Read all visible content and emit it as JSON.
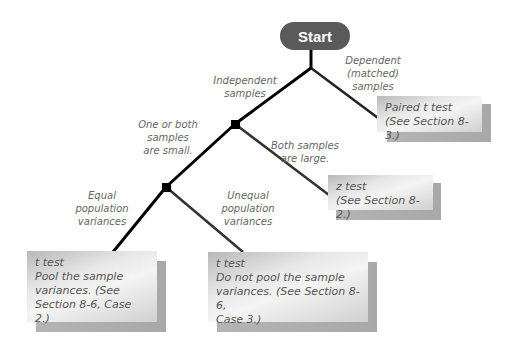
{
  "start": {
    "label": "Start"
  },
  "edges_labels": {
    "independent": "Independent\nsamples",
    "dependent": "Dependent\n(matched)\nsamples",
    "small": "One or both\nsamples\nare small.",
    "large": "Both samples\nare large.",
    "equal": "Equal\npopulation\nvariances",
    "unequal": "Unequal\npopulation\nvariances"
  },
  "boxes": {
    "paired": "Paired t test\n(See Section 8-3.)",
    "z_test": "z test\n(See Section 8-2.)",
    "pooled": "t test\nPool the sample\nvariances. (See\nSection 8-6, Case 2.)",
    "unpooled": "t test\nDo not pool the sample\nvariances. (See Section 8-6,\nCase 3.)"
  },
  "colors": {
    "start_fill": "#5a5a5a",
    "line": "#000000",
    "label_text": "#666666",
    "box_text": "#555555"
  }
}
